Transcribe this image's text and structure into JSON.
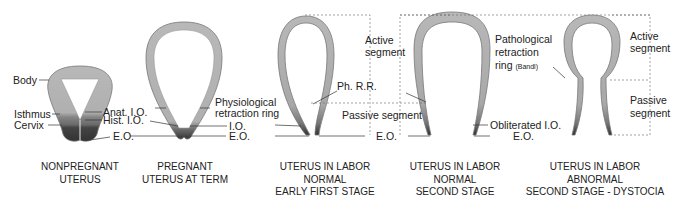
{
  "figure": {
    "colors": {
      "wall_fill": "#b5b5b5",
      "wall_edge": "#8a8a8a",
      "cervix_dark": "#3a3a3a",
      "isthmus_mid": "#7a7a7a",
      "leader_line": "#333333",
      "dashed_line": "#666666",
      "text": "#222222"
    },
    "panels": [
      {
        "id": "nonpregnant",
        "caption": [
          "NONPREGNANT",
          "UTERUS"
        ],
        "labels": {
          "body": "Body",
          "isthmus": "Isthmus",
          "cervix": "Cervix",
          "anat_io": "Anat. I.O.",
          "hist_io": "Hist. I.O.",
          "eo": "E.O."
        }
      },
      {
        "id": "pregnant-term",
        "caption": [
          "PREGNANT",
          "UTERUS AT TERM"
        ],
        "labels": {
          "physiological_ring_1": "Physiological",
          "physiological_ring_2": "retraction ring",
          "io": "I.O.",
          "eo": "E.O."
        }
      },
      {
        "id": "labor-early-first",
        "caption": [
          "UTERUS IN LABOR",
          "NORMAL",
          "EARLY FIRST STAGE"
        ],
        "labels": {
          "active_1": "Active",
          "active_2": "segment",
          "ph_rr": "Ph. R.R.",
          "passive": "Passive segment",
          "eo": "E.O."
        }
      },
      {
        "id": "labor-second",
        "caption": [
          "UTERUS IN LABOR",
          "NORMAL",
          "SECOND STAGE"
        ],
        "labels": {
          "obliterated_io": "Obliterated I.O.",
          "eo": "E.O."
        }
      },
      {
        "id": "labor-dystocia",
        "caption": [
          "UTERUS IN LABOR",
          "ABNORMAL",
          "SECOND STAGE - DYSTOCIA"
        ],
        "labels": {
          "pathological_1": "Pathological",
          "pathological_2": "retraction",
          "pathological_3": "ring",
          "pathological_band": "(Bandl)",
          "active_1": "Active",
          "active_2": "segment",
          "passive_1": "Passive",
          "passive_2": "segment"
        }
      }
    ]
  }
}
